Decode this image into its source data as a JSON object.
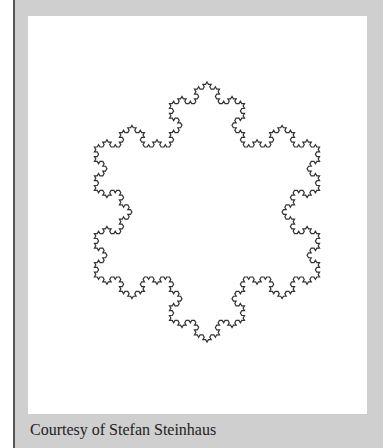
{
  "figure": {
    "iterations": 4,
    "stroke_color": "#333333",
    "caption": "Courtesy of Stefan Steinhaus"
  }
}
